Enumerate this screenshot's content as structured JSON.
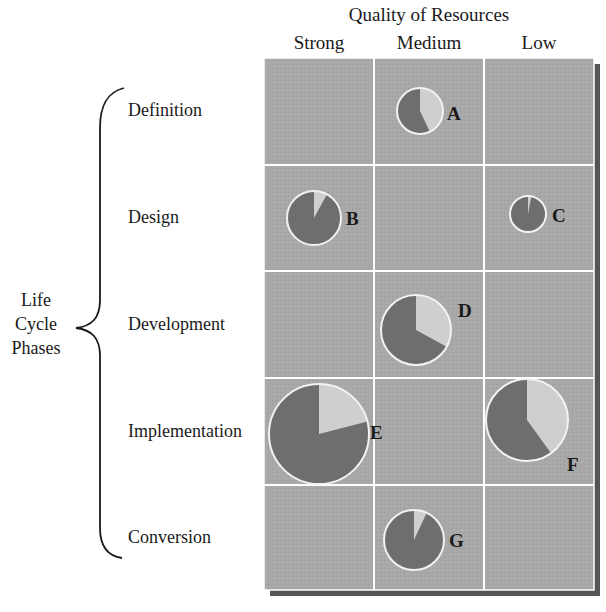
{
  "title": "Quality of Resources",
  "columns": [
    "Strong",
    "Medium",
    "Low"
  ],
  "rows": [
    "Definition",
    "Design",
    "Development",
    "Implementation",
    "Conversion"
  ],
  "axis_label": {
    "line1": "Life",
    "line2": "Cycle",
    "line3": "Phases"
  },
  "colors": {
    "grid_bg": "#a6a6a6",
    "grid_lines": "#ffffff",
    "shadow": "#5a5a5a",
    "pie_dark": "#6e6e6e",
    "pie_light": "#cfcfcf",
    "pie_border": "#f2f2f2"
  },
  "bubbles": [
    {
      "label": "A",
      "row": "Definition",
      "column": "Medium",
      "relative_size": 23,
      "light_fraction": 0.43
    },
    {
      "label": "B",
      "row": "Design",
      "column": "Strong",
      "relative_size": 27,
      "light_fraction": 0.08
    },
    {
      "label": "C",
      "row": "Design",
      "column": "Low",
      "relative_size": 18,
      "light_fraction": 0.03
    },
    {
      "label": "D",
      "row": "Development",
      "column": "Medium",
      "relative_size": 35,
      "light_fraction": 0.33
    },
    {
      "label": "E",
      "row": "Implementation",
      "column": "Strong",
      "relative_size": 50,
      "light_fraction": 0.21
    },
    {
      "label": "F",
      "row": "Implementation",
      "column": "Low",
      "relative_size": 41,
      "light_fraction": 0.4
    },
    {
      "label": "G",
      "row": "Conversion",
      "column": "Medium",
      "relative_size": 30,
      "light_fraction": 0.07
    }
  ]
}
